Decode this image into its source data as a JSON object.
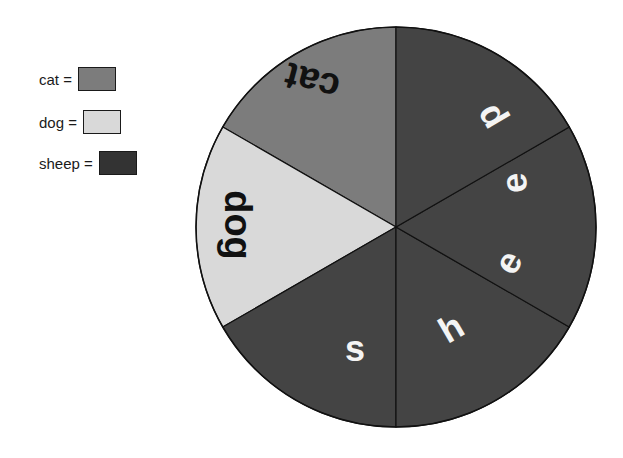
{
  "legend": [
    {
      "label": "cat =",
      "color": "#7c7c7c"
    },
    {
      "label": "dog =",
      "color": "#d9d9d9"
    },
    {
      "label": "sheep =",
      "color": "#333333"
    }
  ],
  "pie": {
    "center": [
      396,
      227
    ],
    "radius": 200,
    "slices": [
      {
        "category": "cat",
        "start_deg": 90,
        "end_deg": 150,
        "color": "#7c7c7c",
        "text": "cat",
        "text_color": "#111111"
      },
      {
        "category": "dog",
        "start_deg": 150,
        "end_deg": 210,
        "color": "#d9d9d9",
        "text": "dog",
        "text_color": "#111111"
      },
      {
        "category": "sheep",
        "start_deg": 210,
        "end_deg": 270,
        "color": "#444444",
        "text": "s",
        "text_color": "#f4f4f4"
      },
      {
        "category": "sheep",
        "start_deg": 270,
        "end_deg": 330,
        "color": "#444444",
        "text": "h",
        "text_color": "#f4f4f4"
      },
      {
        "category": "sheep",
        "start_deg": 330,
        "end_deg": 390,
        "color": "#444444",
        "text": "ee",
        "text_color": "#f4f4f4"
      },
      {
        "category": "sheep",
        "start_deg": 30,
        "end_deg": 90,
        "color": "#444444",
        "text": "p",
        "text_color": "#f4f4f4"
      }
    ],
    "labels": [
      {
        "text": "cat",
        "x": 312,
        "y": 82,
        "rotate": 195,
        "size": 38,
        "color": "#111111"
      },
      {
        "text": "dog",
        "x": 238,
        "y": 225,
        "rotate": 90,
        "size": 38,
        "color": "#111111"
      },
      {
        "text": "s",
        "x": 355,
        "y": 348,
        "rotate": 0,
        "size": 36,
        "color": "#f4f4f4"
      },
      {
        "text": "h",
        "x": 451,
        "y": 328,
        "rotate": -30,
        "size": 36,
        "color": "#f4f4f4"
      },
      {
        "text": "e",
        "x": 508,
        "y": 262,
        "rotate": -60,
        "size": 36,
        "color": "#f4f4f4"
      },
      {
        "text": "e",
        "x": 514,
        "y": 183,
        "rotate": -95,
        "size": 36,
        "color": "#f4f4f4"
      },
      {
        "text": "p",
        "x": 489,
        "y": 118,
        "rotate": -120,
        "size": 36,
        "color": "#f4f4f4"
      }
    ]
  }
}
